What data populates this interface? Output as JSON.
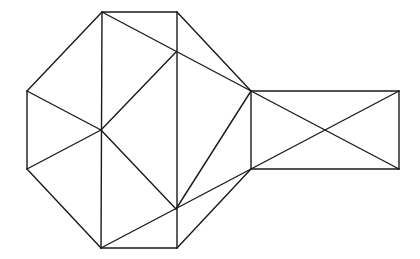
{
  "diagram": {
    "width": 420,
    "height": 259,
    "stroke_color": "#1a1a1a",
    "background": "#ffffff",
    "vertices": {
      "A": [
        102,
        12
      ],
      "B": [
        177,
        12
      ],
      "C": [
        251,
        91
      ],
      "D": [
        251,
        169
      ],
      "E": [
        177,
        248
      ],
      "F": [
        101,
        248
      ],
      "G": [
        27,
        169
      ],
      "H": [
        27,
        91
      ],
      "P": [
        101,
        130
      ],
      "Q": [
        176,
        52
      ],
      "R": [
        176,
        209
      ],
      "S": [
        399,
        91
      ],
      "T": [
        399,
        169
      ]
    },
    "edges": [
      [
        "A",
        "B"
      ],
      [
        "B",
        "C"
      ],
      [
        "C",
        "D"
      ],
      [
        "D",
        "E"
      ],
      [
        "E",
        "F"
      ],
      [
        "F",
        "G"
      ],
      [
        "G",
        "H"
      ],
      [
        "H",
        "A"
      ],
      [
        "A",
        "F"
      ],
      [
        "B",
        "E"
      ],
      [
        "A",
        "C"
      ],
      [
        "P",
        "Q"
      ],
      [
        "H",
        "P"
      ],
      [
        "G",
        "P"
      ],
      [
        "P",
        "R"
      ],
      [
        "C",
        "R"
      ],
      [
        "F",
        "D"
      ],
      [
        "C",
        "S"
      ],
      [
        "S",
        "T"
      ],
      [
        "T",
        "D"
      ],
      [
        "C",
        "T"
      ],
      [
        "D",
        "S"
      ]
    ]
  }
}
